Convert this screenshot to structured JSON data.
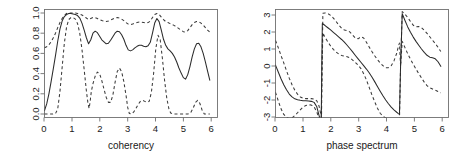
{
  "figure": {
    "background": "#ffffff",
    "panel_count": 2,
    "line_color": "#2b2b2b",
    "frame_color": "#6f6f6f"
  },
  "chart_data": [
    {
      "type": "line",
      "title": "",
      "xlabel": "coherency",
      "ylabel": "",
      "xlim": [
        0,
        6.28
      ],
      "ylim": [
        0,
        1
      ],
      "xticks": [
        0,
        1,
        2,
        3,
        4,
        5,
        6
      ],
      "xticklabels": [
        "0",
        "1",
        "2",
        "3",
        "4",
        "5",
        "6"
      ],
      "yticks": [
        0.0,
        0.2,
        0.4,
        0.6,
        0.8,
        1.0
      ],
      "yticklabels": [
        "0.0",
        "0.2",
        "0.4",
        "0.6",
        "0.8",
        "1.0"
      ],
      "grid": false,
      "legend": "none",
      "series": [
        {
          "name": "coherency estimate",
          "style": "solid",
          "x": [
            0.0,
            0.08,
            0.16,
            0.24,
            0.32,
            0.4,
            0.48,
            0.56,
            0.64,
            0.72,
            0.8,
            0.88,
            0.96,
            1.04,
            1.12,
            1.2,
            1.28,
            1.36,
            1.44,
            1.52,
            1.6,
            1.68,
            1.76,
            1.84,
            1.92,
            2.0,
            2.08,
            2.16,
            2.24,
            2.32,
            2.4,
            2.48,
            2.56,
            2.64,
            2.72,
            2.8,
            2.88,
            2.96,
            3.04,
            3.12,
            3.2,
            3.28,
            3.36,
            3.44,
            3.52,
            3.6,
            3.68,
            3.76,
            3.84,
            3.92,
            4.0,
            4.08,
            4.16,
            4.24,
            4.32,
            4.4,
            4.48,
            4.56,
            4.64,
            4.72,
            4.8,
            4.88,
            4.96,
            5.04,
            5.12,
            5.2,
            5.28,
            5.36,
            5.44,
            5.52,
            5.6,
            5.68,
            5.76,
            5.84,
            5.92,
            6.0
          ],
          "y": [
            0.035,
            0.1,
            0.2,
            0.32,
            0.45,
            0.58,
            0.72,
            0.84,
            0.92,
            0.965,
            0.985,
            0.995,
            0.995,
            0.99,
            0.985,
            0.975,
            0.95,
            0.9,
            0.83,
            0.755,
            0.695,
            0.735,
            0.8,
            0.82,
            0.805,
            0.77,
            0.735,
            0.715,
            0.695,
            0.7,
            0.73,
            0.765,
            0.8,
            0.82,
            0.815,
            0.785,
            0.74,
            0.68,
            0.635,
            0.625,
            0.635,
            0.655,
            0.67,
            0.68,
            0.68,
            0.67,
            0.665,
            0.675,
            0.71,
            0.8,
            0.9,
            0.945,
            0.915,
            0.83,
            0.74,
            0.68,
            0.645,
            0.625,
            0.6,
            0.565,
            0.515,
            0.455,
            0.405,
            0.36,
            0.345,
            0.39,
            0.47,
            0.565,
            0.645,
            0.695,
            0.7,
            0.665,
            0.6,
            0.515,
            0.425,
            0.335
          ]
        },
        {
          "name": "upper confidence band",
          "style": "dashed",
          "x": [
            0.0,
            0.08,
            0.16,
            0.24,
            0.32,
            0.4,
            0.48,
            0.56,
            0.64,
            0.72,
            0.8,
            0.88,
            0.96,
            1.04,
            1.12,
            1.2,
            1.28,
            1.36,
            1.44,
            1.52,
            1.6,
            1.68,
            1.76,
            1.84,
            1.92,
            2.0,
            2.08,
            2.16,
            2.24,
            2.32,
            2.4,
            2.48,
            2.56,
            2.64,
            2.72,
            2.8,
            2.88,
            2.96,
            3.04,
            3.12,
            3.2,
            3.28,
            3.36,
            3.44,
            3.52,
            3.6,
            3.68,
            3.76,
            3.84,
            3.92,
            4.0,
            4.08,
            4.16,
            4.24,
            4.32,
            4.4,
            4.48,
            4.56,
            4.64,
            4.72,
            4.8,
            4.88,
            4.96,
            5.04,
            5.12,
            5.2,
            5.28,
            5.36,
            5.44,
            5.52,
            5.6,
            5.68,
            5.76,
            5.84,
            5.92,
            6.0
          ],
          "y": [
            0.655,
            0.665,
            0.685,
            0.715,
            0.755,
            0.8,
            0.855,
            0.905,
            0.945,
            0.975,
            0.995,
            1.0,
            1.0,
            1.0,
            1.0,
            0.995,
            0.99,
            0.98,
            0.965,
            0.95,
            0.935,
            0.945,
            0.955,
            0.955,
            0.945,
            0.935,
            0.925,
            0.92,
            0.915,
            0.92,
            0.93,
            0.94,
            0.95,
            0.955,
            0.95,
            0.94,
            0.925,
            0.905,
            0.89,
            0.885,
            0.89,
            0.9,
            0.905,
            0.91,
            0.91,
            0.905,
            0.9,
            0.905,
            0.92,
            0.955,
            0.985,
            0.995,
            0.985,
            0.96,
            0.935,
            0.915,
            0.905,
            0.895,
            0.885,
            0.875,
            0.86,
            0.845,
            0.83,
            0.815,
            0.81,
            0.825,
            0.855,
            0.885,
            0.905,
            0.915,
            0.915,
            0.9,
            0.88,
            0.855,
            0.83,
            0.81
          ]
        },
        {
          "name": "lower confidence band",
          "style": "dashed",
          "x": [
            0.0,
            0.1,
            0.2,
            0.3,
            0.4,
            0.48,
            0.56,
            0.64,
            0.72,
            0.8,
            0.88,
            0.96,
            1.04,
            1.12,
            1.2,
            1.28,
            1.36,
            1.44,
            1.52,
            1.58,
            1.62,
            1.66,
            1.7,
            1.76,
            1.84,
            1.92,
            2.0,
            2.08,
            2.16,
            2.24,
            2.32,
            2.4,
            2.48,
            2.56,
            2.64,
            2.72,
            2.8,
            2.88,
            2.96,
            3.02,
            3.08,
            3.16,
            3.24,
            3.32,
            3.4,
            3.48,
            3.56,
            3.64,
            3.72,
            3.8,
            3.88,
            3.96,
            4.04,
            4.12,
            4.2,
            4.28,
            4.36,
            4.44,
            4.52,
            4.58,
            4.66,
            4.8,
            5.0,
            5.2,
            5.3,
            5.4,
            5.48,
            5.56,
            5.64,
            5.72,
            5.8,
            5.9,
            6.0
          ],
          "y": [
            0.0,
            0.0,
            0.0,
            0.0,
            0.005,
            0.05,
            0.22,
            0.46,
            0.7,
            0.86,
            0.935,
            0.955,
            0.955,
            0.94,
            0.895,
            0.8,
            0.64,
            0.44,
            0.23,
            0.1,
            0.055,
            0.13,
            0.225,
            0.3,
            0.375,
            0.415,
            0.4,
            0.33,
            0.245,
            0.165,
            0.115,
            0.115,
            0.185,
            0.31,
            0.42,
            0.455,
            0.42,
            0.32,
            0.185,
            0.065,
            0.005,
            0.0,
            0.02,
            0.055,
            0.095,
            0.125,
            0.135,
            0.125,
            0.115,
            0.125,
            0.215,
            0.4,
            0.645,
            0.78,
            0.735,
            0.55,
            0.33,
            0.155,
            0.045,
            0.01,
            0.0,
            0.0,
            0.0,
            0.0,
            0.01,
            0.06,
            0.115,
            0.135,
            0.105,
            0.04,
            0.0,
            0.0,
            0.0
          ]
        }
      ]
    },
    {
      "type": "line",
      "title": "",
      "xlabel": "phase spectrum",
      "ylabel": "",
      "xlim": [
        0,
        6.28
      ],
      "ylim": [
        -3.3,
        3.3
      ],
      "xticks": [
        0,
        1,
        2,
        3,
        4,
        5,
        6
      ],
      "xticklabels": [
        "0",
        "1",
        "2",
        "3",
        "4",
        "5",
        "6"
      ],
      "yticks": [
        -3,
        -2,
        -1,
        0,
        1,
        2,
        3
      ],
      "yticklabels": [
        "-3",
        "-2",
        "-1",
        "0",
        "1",
        "2",
        "3"
      ],
      "grid": false,
      "legend": "none",
      "series": [
        {
          "name": "phase estimate",
          "style": "solid",
          "x": [
            0.0,
            0.1,
            0.2,
            0.3,
            0.4,
            0.5,
            0.6,
            0.7,
            0.8,
            0.9,
            1.0,
            1.1,
            1.2,
            1.3,
            1.4,
            1.5,
            1.58,
            1.63,
            1.66,
            1.68,
            1.7,
            1.8,
            1.9,
            2.0,
            2.1,
            2.2,
            2.3,
            2.4,
            2.5,
            2.6,
            2.7,
            2.8,
            2.9,
            3.0,
            3.1,
            3.2,
            3.3,
            3.4,
            3.5,
            3.6,
            3.7,
            3.8,
            3.9,
            4.0,
            4.1,
            4.2,
            4.3,
            4.4,
            4.46,
            4.5,
            4.54,
            4.6,
            4.7,
            4.8,
            4.9,
            5.0,
            5.1,
            5.2,
            5.3,
            5.4,
            5.5,
            5.6,
            5.7,
            5.8,
            5.9,
            6.0
          ],
          "y": [
            0.05,
            -0.35,
            -0.75,
            -1.1,
            -1.4,
            -1.65,
            -1.82,
            -1.93,
            -1.99,
            -2.02,
            -2.04,
            -2.05,
            -2.06,
            -2.08,
            -2.14,
            -2.4,
            -2.9,
            -3.2,
            -3.25,
            0.0,
            2.5,
            2.38,
            2.25,
            2.12,
            1.98,
            1.84,
            1.7,
            1.56,
            1.4,
            1.22,
            1.03,
            0.83,
            0.62,
            0.42,
            0.22,
            0.02,
            -0.18,
            -0.4,
            -0.65,
            -0.92,
            -1.2,
            -1.48,
            -1.75,
            -2.0,
            -2.22,
            -2.42,
            -2.58,
            -2.72,
            -2.8,
            -2.85,
            0.0,
            3.08,
            2.68,
            2.3,
            1.98,
            1.7,
            1.45,
            1.22,
            1.0,
            0.8,
            0.63,
            0.52,
            0.48,
            0.42,
            0.25,
            -0.02
          ]
        },
        {
          "name": "upper confidence band",
          "style": "dashed",
          "x": [
            0.0,
            0.1,
            0.2,
            0.3,
            0.4,
            0.5,
            0.6,
            0.7,
            0.8,
            0.9,
            1.0,
            1.1,
            1.2,
            1.3,
            1.4,
            1.5,
            1.58,
            1.64,
            1.67,
            1.69,
            1.72,
            1.8,
            1.9,
            2.0,
            2.1,
            2.2,
            2.3,
            2.4,
            2.5,
            2.6,
            2.7,
            2.8,
            2.9,
            3.0,
            3.1,
            3.2,
            3.3,
            3.4,
            3.5,
            3.6,
            3.7,
            3.8,
            3.9,
            4.0,
            4.1,
            4.2,
            4.3,
            4.4,
            4.46,
            4.5,
            4.54,
            4.6,
            4.7,
            4.8,
            4.9,
            5.0,
            5.1,
            5.2,
            5.3,
            5.4,
            5.5,
            5.6,
            5.7,
            5.8,
            5.9,
            6.0
          ],
          "y": [
            1.5,
            1.08,
            0.62,
            0.18,
            -0.28,
            -0.72,
            -1.1,
            -1.42,
            -1.66,
            -1.82,
            -1.9,
            -1.92,
            -1.92,
            -1.92,
            -1.94,
            -2.05,
            -2.35,
            -2.8,
            -3.05,
            0.0,
            3.1,
            3.12,
            3.08,
            2.98,
            2.82,
            2.62,
            2.4,
            2.22,
            2.12,
            2.08,
            2.0,
            1.82,
            1.65,
            1.6,
            1.72,
            1.65,
            1.4,
            1.12,
            0.85,
            0.6,
            0.38,
            0.18,
            0.02,
            -0.1,
            -0.1,
            0.02,
            0.3,
            0.75,
            1.15,
            1.35,
            0.0,
            3.2,
            3.05,
            2.85,
            2.62,
            2.4,
            2.3,
            2.32,
            2.25,
            2.1,
            1.92,
            1.72,
            1.52,
            1.32,
            1.1,
            0.85
          ]
        },
        {
          "name": "lower confidence band",
          "style": "dashed",
          "x": [
            0.0,
            0.1,
            0.2,
            0.3,
            0.4,
            0.5,
            0.6,
            0.7,
            0.8,
            0.9,
            1.0,
            1.1,
            1.2,
            1.3,
            1.4,
            1.5,
            1.58,
            1.63,
            1.66,
            1.69,
            1.72,
            1.8,
            1.9,
            2.0,
            2.1,
            2.2,
            2.3,
            2.4,
            2.5,
            2.6,
            2.7,
            2.8,
            2.9,
            3.0,
            3.1,
            3.2,
            3.3,
            3.4,
            3.5,
            3.6,
            3.7,
            3.8,
            3.9,
            4.0,
            4.1,
            4.2,
            4.3,
            4.4,
            4.46,
            4.5,
            4.54,
            4.6,
            4.7,
            4.8,
            4.9,
            5.0,
            5.1,
            5.2,
            5.3,
            5.4,
            5.5,
            5.6,
            5.7,
            5.8,
            5.9,
            6.0
          ],
          "y": [
            -1.55,
            -2.05,
            -2.52,
            -2.85,
            -3.02,
            -3.1,
            -3.05,
            -2.92,
            -2.75,
            -2.58,
            -2.42,
            -2.32,
            -2.28,
            -2.3,
            -2.4,
            -2.7,
            -3.1,
            -3.25,
            -3.28,
            0.0,
            1.95,
            1.68,
            1.42,
            1.18,
            0.98,
            0.82,
            0.7,
            0.62,
            0.58,
            0.55,
            0.48,
            0.35,
            0.2,
            0.05,
            -0.15,
            -0.45,
            -0.82,
            -1.25,
            -1.7,
            -2.1,
            -2.48,
            -2.78,
            -2.95,
            -3.05,
            -3.15,
            -3.2,
            -3.22,
            -3.22,
            -3.22,
            -3.22,
            0.0,
            1.45,
            1.08,
            0.72,
            0.4,
            0.1,
            -0.18,
            -0.45,
            -0.7,
            -0.95,
            -1.15,
            -1.28,
            -1.35,
            -1.42,
            -1.5,
            -1.58
          ]
        }
      ]
    }
  ]
}
